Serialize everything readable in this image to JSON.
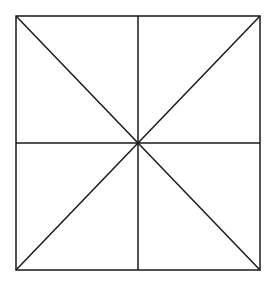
{
  "diagram": {
    "type": "square-divided-into-eight-triangles",
    "canvas": {
      "width": 270,
      "height": 283,
      "background": "#ffffff"
    },
    "stroke": {
      "color": "#1a1a1a",
      "width": 1.5
    },
    "square": {
      "x1": 16,
      "y1": 16,
      "x2": 260,
      "y2": 270
    },
    "center": {
      "x": 138,
      "y": 143
    },
    "lines": [
      {
        "name": "vertical-midline",
        "x1": 138,
        "y1": 16,
        "x2": 138,
        "y2": 270
      },
      {
        "name": "horizontal-midline",
        "x1": 16,
        "y1": 143,
        "x2": 260,
        "y2": 143
      },
      {
        "name": "diagonal-main",
        "x1": 16,
        "y1": 16,
        "x2": 260,
        "y2": 270
      },
      {
        "name": "diagonal-anti",
        "x1": 260,
        "y1": 16,
        "x2": 16,
        "y2": 270
      }
    ]
  }
}
